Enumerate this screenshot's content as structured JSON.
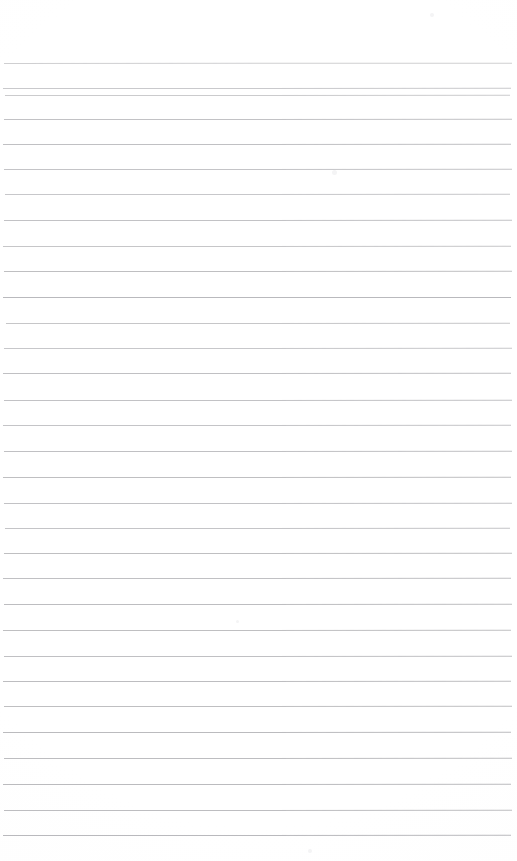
{
  "document": {
    "kind": "scanned-ruled-paper",
    "title": "Blank Ruled Notebook Page",
    "page_width": 517,
    "page_height": 861,
    "background_color": "#ffffff",
    "rule_color": "#a8a8ac",
    "content_text": "",
    "handwriting_text": "",
    "visible_labels": []
  },
  "layout": {
    "top_margin_px": 63,
    "bottom_margin_px": 27,
    "line_spacing_px": 25.5,
    "rule_count": 31,
    "left_inset_px": 4,
    "right_inset_px": 508
  },
  "rules": [
    {
      "y": 63,
      "x1": 4,
      "x2": 512,
      "opacity": 0.55,
      "slope": 0.9
    },
    {
      "y": 88,
      "x1": 3,
      "x2": 511,
      "opacity": 0.62,
      "slope": 0.6
    },
    {
      "y": 95,
      "x1": 5,
      "x2": 510,
      "opacity": 0.6,
      "slope": 0.8
    },
    {
      "y": 119,
      "x1": 4,
      "x2": 512,
      "opacity": 0.7,
      "slope": 0.5
    },
    {
      "y": 144,
      "x1": 3,
      "x2": 511,
      "opacity": 0.72,
      "slope": 0.7
    },
    {
      "y": 169,
      "x1": 4,
      "x2": 512,
      "opacity": 0.68,
      "slope": 0.6
    },
    {
      "y": 194,
      "x1": 5,
      "x2": 510,
      "opacity": 0.64,
      "slope": 0.8
    },
    {
      "y": 220,
      "x1": 4,
      "x2": 512,
      "opacity": 0.7,
      "slope": 0.5
    },
    {
      "y": 246,
      "x1": 3,
      "x2": 511,
      "opacity": 0.66,
      "slope": 0.7
    },
    {
      "y": 271,
      "x1": 4,
      "x2": 512,
      "opacity": 0.74,
      "slope": 0.6
    },
    {
      "y": 297,
      "x1": 3,
      "x2": 511,
      "opacity": 0.8,
      "slope": 0.4
    },
    {
      "y": 323,
      "x1": 6,
      "x2": 510,
      "opacity": 0.66,
      "slope": 0.8
    },
    {
      "y": 348,
      "x1": 4,
      "x2": 512,
      "opacity": 0.64,
      "slope": 0.6
    },
    {
      "y": 373,
      "x1": 3,
      "x2": 511,
      "opacity": 0.72,
      "slope": 0.5
    },
    {
      "y": 400,
      "x1": 4,
      "x2": 512,
      "opacity": 0.7,
      "slope": 0.7
    },
    {
      "y": 425,
      "x1": 3,
      "x2": 511,
      "opacity": 0.68,
      "slope": 0.6
    },
    {
      "y": 451,
      "x1": 4,
      "x2": 512,
      "opacity": 0.72,
      "slope": 0.5
    },
    {
      "y": 477,
      "x1": 3,
      "x2": 511,
      "opacity": 0.74,
      "slope": 0.7
    },
    {
      "y": 503,
      "x1": 4,
      "x2": 512,
      "opacity": 0.7,
      "slope": 0.6
    },
    {
      "y": 528,
      "x1": 5,
      "x2": 510,
      "opacity": 0.68,
      "slope": 0.8
    },
    {
      "y": 553,
      "x1": 4,
      "x2": 512,
      "opacity": 0.74,
      "slope": 0.5
    },
    {
      "y": 578,
      "x1": 3,
      "x2": 511,
      "opacity": 0.72,
      "slope": 0.6
    },
    {
      "y": 604,
      "x1": 4,
      "x2": 512,
      "opacity": 0.76,
      "slope": 0.5
    },
    {
      "y": 630,
      "x1": 3,
      "x2": 511,
      "opacity": 0.74,
      "slope": 0.7
    },
    {
      "y": 656,
      "x1": 4,
      "x2": 512,
      "opacity": 0.72,
      "slope": 0.6
    },
    {
      "y": 681,
      "x1": 3,
      "x2": 511,
      "opacity": 0.76,
      "slope": 0.5
    },
    {
      "y": 706,
      "x1": 4,
      "x2": 512,
      "opacity": 0.74,
      "slope": 0.6
    },
    {
      "y": 732,
      "x1": 3,
      "x2": 511,
      "opacity": 0.78,
      "slope": 0.5
    },
    {
      "y": 758,
      "x1": 4,
      "x2": 512,
      "opacity": 0.76,
      "slope": 0.7
    },
    {
      "y": 784,
      "x1": 3,
      "x2": 511,
      "opacity": 0.78,
      "slope": 0.5
    },
    {
      "y": 810,
      "x1": 4,
      "x2": 512,
      "opacity": 0.76,
      "slope": 0.6
    },
    {
      "y": 835,
      "x1": 3,
      "x2": 511,
      "opacity": 0.8,
      "slope": 0.5
    }
  ],
  "specks": [
    {
      "x": 430,
      "y": 13,
      "size": 4
    },
    {
      "x": 332,
      "y": 170,
      "size": 5
    },
    {
      "x": 308,
      "y": 849,
      "size": 4
    },
    {
      "x": 236,
      "y": 620,
      "size": 3
    }
  ]
}
